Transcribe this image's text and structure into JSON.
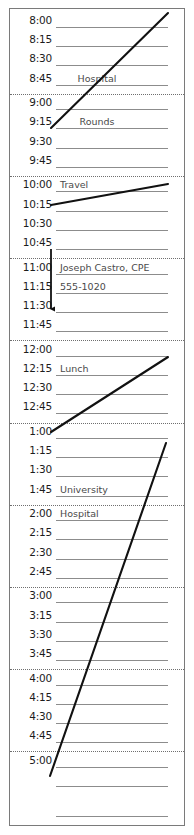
{
  "planner": {
    "title": "Daily Appointment Schedule",
    "rule_color": "#8c8c8c",
    "separator_color": "#6f6f6f",
    "ink_color": "#111111",
    "time_text_color": "#1c1c1c",
    "entry_text_color": "#4a4a4a",
    "rows": [
      {
        "time": "8:00",
        "entry": ""
      },
      {
        "time": "8:15",
        "entry": ""
      },
      {
        "time": "8:30",
        "entry": ""
      },
      {
        "time": "8:45",
        "entry": "Hospital",
        "entry_align": "center"
      },
      {
        "time": "9:00",
        "entry": ""
      },
      {
        "time": "9:15",
        "entry": "Rounds",
        "entry_align": "center"
      },
      {
        "time": "9:30",
        "entry": ""
      },
      {
        "time": "9:45",
        "entry": ""
      },
      {
        "time": "10:00",
        "entry": "Travel"
      },
      {
        "time": "10:15",
        "entry": ""
      },
      {
        "time": "10:30",
        "entry": ""
      },
      {
        "time": "10:45",
        "entry": ""
      },
      {
        "time": "11:00",
        "entry": "Joseph Castro, CPE"
      },
      {
        "time": "11:15",
        "entry": "555-1020"
      },
      {
        "time": "11:30",
        "entry": ""
      },
      {
        "time": "11:45",
        "entry": ""
      },
      {
        "time": "12:00",
        "entry": ""
      },
      {
        "time": "12:15",
        "entry": "Lunch"
      },
      {
        "time": "12:30",
        "entry": ""
      },
      {
        "time": "12:45",
        "entry": ""
      },
      {
        "time": "1:00",
        "entry": ""
      },
      {
        "time": "1:15",
        "entry": ""
      },
      {
        "time": "1:30",
        "entry": ""
      },
      {
        "time": "1:45",
        "entry": "University"
      },
      {
        "time": "2:00",
        "entry": "Hospital"
      },
      {
        "time": "2:15",
        "entry": ""
      },
      {
        "time": "2:30",
        "entry": ""
      },
      {
        "time": "2:45",
        "entry": ""
      },
      {
        "time": "3:00",
        "entry": ""
      },
      {
        "time": "3:15",
        "entry": ""
      },
      {
        "time": "3:30",
        "entry": ""
      },
      {
        "time": "3:45",
        "entry": ""
      },
      {
        "time": "4:00",
        "entry": ""
      },
      {
        "time": "4:15",
        "entry": ""
      },
      {
        "time": "4:30",
        "entry": ""
      },
      {
        "time": "4:45",
        "entry": ""
      },
      {
        "time": "5:00",
        "entry": ""
      },
      {
        "time": "",
        "entry": ""
      }
    ],
    "appointments": [
      {
        "label": "Hospital",
        "start": "8:45",
        "end": "9:45",
        "mark": "diagonal-bracket"
      },
      {
        "label": "Rounds",
        "start": "9:00",
        "end": "9:45",
        "mark": "diagonal-bracket"
      },
      {
        "label": "Travel",
        "start": "10:00",
        "end": "10:15",
        "mark": "diagonal-bracket"
      },
      {
        "label": "Joseph Castro, CPE",
        "start": "11:00",
        "end": "11:45",
        "mark": "down-arrow"
      },
      {
        "label": "555-1020",
        "start": "11:15",
        "end": "11:15",
        "mark": "none"
      },
      {
        "label": "Lunch",
        "start": "12:00",
        "end": "12:45",
        "mark": "diagonal-bracket"
      },
      {
        "label": "University",
        "start": "1:45",
        "end": "1:45",
        "mark": "none"
      },
      {
        "label": "Hospital",
        "start": "2:00",
        "end": "4:45",
        "mark": "diagonal-bracket"
      }
    ]
  }
}
